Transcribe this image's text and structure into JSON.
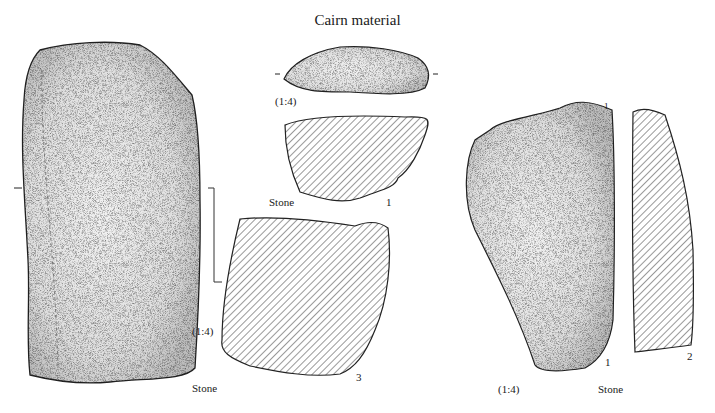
{
  "title": "Cairn material",
  "figures": [
    {
      "id": "large-stone-left",
      "scale": "(1:4)",
      "material": "Stone"
    },
    {
      "id": "stone-1",
      "scale": "(1:4)",
      "material": "Stone",
      "number": "1"
    },
    {
      "id": "stone-3",
      "number": "3"
    },
    {
      "id": "stone-right",
      "scale": "(1:4)",
      "material": "Stone",
      "top_mark": "1",
      "bottom_mark": "1",
      "section_number": "2"
    }
  ]
}
